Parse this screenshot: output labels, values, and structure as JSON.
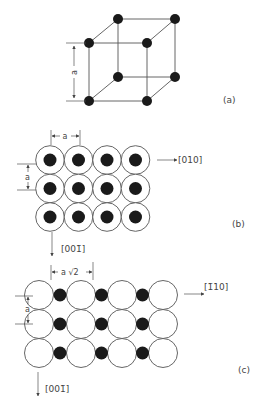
{
  "colors": {
    "line": "#555555",
    "atom_fill": "#1a1a1a",
    "open_fill": "#ffffff",
    "text": "#444444"
  },
  "panels": [
    {
      "id": "a",
      "label": "(a)",
      "description": "Simple cubic unit cell with atoms at 8 corners",
      "dimension_label": "a"
    },
    {
      "id": "b",
      "label": "(b)",
      "description": "Top view: 3x4 grid of large open circles each containing a dark atom",
      "dimension_horizontal": "a",
      "dimension_vertical": "a",
      "direction_right": "[010]",
      "direction_down": "[001̄]",
      "rows": 3,
      "cols": 4
    },
    {
      "id": "c",
      "label": "(c)",
      "description": "Side view: 3x4 grid of large open circles with dark atoms between them",
      "dimension_horizontal": "a √2",
      "dimension_vertical": "a",
      "direction_right": "[1̄10]",
      "direction_down": "[001̄]",
      "rows": 3,
      "cols": 4
    }
  ]
}
